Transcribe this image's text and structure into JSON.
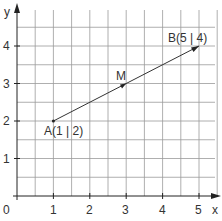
{
  "diagram": {
    "axes": {
      "x_label": "x",
      "y_label": "y",
      "origin_label": "0",
      "x_ticks": [
        "1",
        "2",
        "3",
        "4",
        "5"
      ],
      "y_ticks": [
        "1",
        "2",
        "3",
        "4"
      ],
      "grid_step": 0.5
    },
    "points": {
      "A": {
        "label": "A(1 | 2)",
        "x": 1,
        "y": 2
      },
      "B": {
        "label": "B(5 | 4)",
        "x": 5,
        "y": 4
      },
      "M": {
        "label": "M",
        "x": 3,
        "y": 3
      }
    },
    "segment": {
      "from": "A",
      "to": "B"
    },
    "colors": {
      "grid": "#9a9a9a",
      "axis": "#222222",
      "text": "#333333"
    }
  }
}
